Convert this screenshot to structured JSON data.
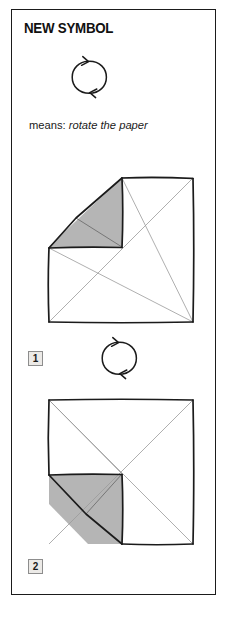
{
  "page": {
    "title": "NEW SYMBOL",
    "background_color": "#ffffff",
    "frame_color": "#1b1b1b"
  },
  "legend": {
    "symbol_name": "rotate-paper-symbol",
    "means_label": "means:",
    "means_value": "rotate the paper"
  },
  "steps": [
    {
      "number": "1",
      "figure_name": "folded-square-step-1",
      "description": "square with both diagonals, top-left corner folded, upper-left quadrant shaded",
      "shading_color": "#b5b5b5",
      "outline_color": "#1b1b1b",
      "crease_color": "#9a9a9a"
    },
    {
      "number": "2",
      "figure_name": "folded-square-step-2",
      "description": "square rotated, bottom-left corner folded, lower-left quadrant shaded",
      "shading_color": "#b5b5b5",
      "outline_color": "#1b1b1b",
      "crease_color": "#9a9a9a"
    }
  ],
  "symbols": {
    "rotate": {
      "name": "rotate-paper-symbol",
      "stroke_color": "#1b1b1b",
      "occurrences": 2
    }
  }
}
